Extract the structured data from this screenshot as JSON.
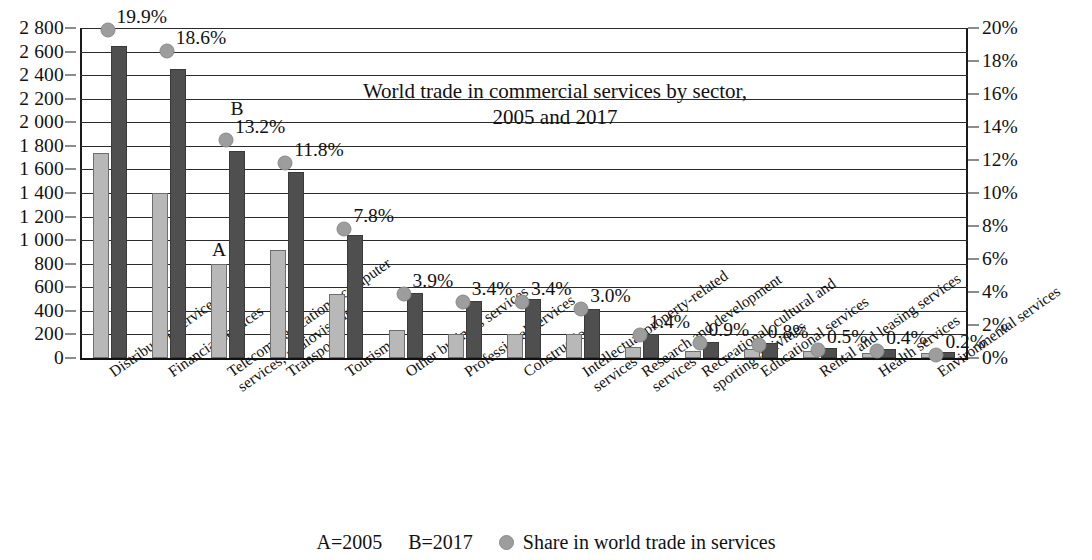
{
  "chart_data": {
    "type": "bar",
    "title_lines": [
      "World trade in commercial services by sector,",
      "2005 and 2017"
    ],
    "xlabel": "",
    "ylabel": "",
    "ylim": [
      0,
      2800
    ],
    "y2lim": [
      0,
      20
    ],
    "grid": true,
    "legend_position": "bottom",
    "categories": [
      "Distribution services",
      "Financial services",
      "Telecommunications, computer services, audiovisuals",
      "Transport",
      "Tourism",
      "Other business services",
      "Professional services",
      "Construction",
      "Intellectual property-related services",
      "Research and development services",
      "Recreational, cultural and sporting activities",
      "Educational services",
      "Rental and leasing services",
      "Health services",
      "Environmental services"
    ],
    "category_lines": [
      [
        "Distribution services"
      ],
      [
        "Financial services"
      ],
      [
        "Telecommunications, computer",
        "services, audiovisuals"
      ],
      [
        "Transport"
      ],
      [
        "Tourism"
      ],
      [
        "Other business services"
      ],
      [
        "Professional services"
      ],
      [
        "Construction"
      ],
      [
        "Intellectual property-related",
        "services"
      ],
      [
        "Research and development",
        "services"
      ],
      [
        "Recreational, cultural and",
        "sporting activities"
      ],
      [
        "Educational services"
      ],
      [
        "Rental and leasing services"
      ],
      [
        "Health services"
      ],
      [
        "Environmental services"
      ]
    ],
    "series": [
      {
        "name": "A=2005",
        "key": "a",
        "color": "#b8b8b8",
        "values": [
          1740,
          1400,
          800,
          920,
          545,
          235,
          205,
          205,
          205,
          90,
          60,
          80,
          60,
          45,
          45
        ]
      },
      {
        "name": "B=2017",
        "key": "b",
        "color": "#4f4f4f",
        "values": [
          2650,
          2455,
          1760,
          1580,
          1040,
          550,
          480,
          500,
          420,
          200,
          140,
          130,
          85,
          75,
          55
        ]
      }
    ],
    "share_series": {
      "name": "Share in world trade in services",
      "color": "#9d9d9d",
      "unit": "%",
      "values": [
        19.9,
        18.6,
        13.2,
        11.8,
        7.8,
        3.9,
        3.4,
        3.4,
        3.0,
        1.4,
        0.9,
        0.8,
        0.5,
        0.4,
        0.2
      ],
      "labels": [
        "19.9%",
        "18.6%",
        "13.2%",
        "11.8%",
        "7.8%",
        "3.9%",
        "3.4%",
        "3.4%",
        "3.0%",
        "1.4%",
        "0.9%",
        "0.8%",
        "0.5%",
        "0.4%",
        "0.2%"
      ]
    },
    "y_left_ticks": [
      "0",
      "200",
      "400",
      "600",
      "800",
      "1 000",
      "1 200",
      "1 400",
      "1 600",
      "1 800",
      "2 000",
      "2 200",
      "2 400",
      "2 600",
      "2 800"
    ],
    "y_left_values": [
      0,
      200,
      400,
      600,
      800,
      1000,
      1200,
      1400,
      1600,
      1800,
      2000,
      2200,
      2400,
      2600,
      2800
    ],
    "y_right_ticks": [
      "0%",
      "2%",
      "4%",
      "6%",
      "8%",
      "10%",
      "12%",
      "14%",
      "16%",
      "18%",
      "20%"
    ],
    "y_right_values": [
      0,
      2,
      4,
      6,
      8,
      10,
      12,
      14,
      16,
      18,
      20
    ],
    "bar_annotations": [
      {
        "category_index": 2,
        "series": "a",
        "text": "A"
      },
      {
        "category_index": 2,
        "series": "b",
        "text": "B"
      }
    ]
  },
  "legend": {
    "a_label": "A=2005",
    "b_label": "B=2017",
    "share_label": "Share in world trade in services",
    "dot_icon": "filled-circle-marker"
  }
}
